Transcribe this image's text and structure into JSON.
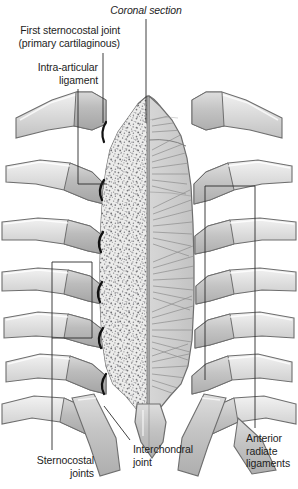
{
  "figure": {
    "background": "#ffffff",
    "colors": {
      "bone_light": "#e8e8e8",
      "bone_mid": "#d2d2d2",
      "cartilage": "#bdbdbd",
      "cartilage_dark": "#ababab",
      "outline": "#6e6e6e",
      "outline_dark": "#4a4a4a",
      "trabecular_fill": "#e4e4e2",
      "stipple": "#7a7a78",
      "ligament_fiber": "#8a8a8a",
      "intra_articular_ligament": "#111111",
      "leader_line": "#2b2b2b",
      "text": "#1d1d1d"
    }
  },
  "labels": [
    {
      "id": "coronal-section",
      "text": "Coronal section",
      "style": "italic",
      "align": "center",
      "x": 146,
      "y": 6,
      "leader": {
        "type": "vertical",
        "x": 146,
        "y1": 18,
        "y2": 123
      }
    },
    {
      "id": "first-sternocostal-joint",
      "text": "First sternocostal joint\n(primary cartilaginous)",
      "style": "normal",
      "align": "right",
      "x": 120,
      "y": 26,
      "leader": {
        "type": "vertical",
        "x": 103,
        "y1": 52,
        "y2": 123
      }
    },
    {
      "id": "intra-articular-ligament",
      "text": "Intra-articular\nligament",
      "style": "normal",
      "align": "right",
      "x": 98,
      "y": 62,
      "leader": {
        "type": "polyline",
        "points": "78,88 78,184 107,184"
      }
    },
    {
      "id": "sternocostal-joints",
      "text": "Sternocostal\njoints",
      "style": "normal",
      "align": "right",
      "x": 94,
      "y": 455,
      "leader": {
        "type": "polyline",
        "points": "52,452 52,262 92,262 92,338 52,338"
      }
    },
    {
      "id": "interchondral-joint",
      "text": "Interchondral\njoint",
      "style": "normal",
      "align": "left",
      "x": 133,
      "y": 444,
      "leader": {
        "type": "polyline",
        "points": "129,441 104,405"
      }
    },
    {
      "id": "anterior-radiate-ligaments",
      "text": "Anterior\nradiate\nligaments",
      "style": "normal",
      "align": "left",
      "x": 246,
      "y": 434,
      "leader": {
        "type": "polyline",
        "points": "255,430 255,186 205,186 205,380"
      }
    }
  ],
  "anatomy": {
    "sternum_parts": [
      "manubrium",
      "body of sternum",
      "xiphoid process"
    ],
    "left_half_rendering": "sectioned — cancellous/trabecular bone shown as stipple",
    "right_half_rendering": "surface — anterior radiate ligament fibres shown as fans",
    "rib_pairs_shown": 7,
    "left_rib_attachment_y": [
      126,
      186,
      238,
      288,
      334,
      378,
      404
    ],
    "right_rib_attachment_y": [
      126,
      186,
      238,
      288,
      334,
      378,
      404
    ]
  }
}
